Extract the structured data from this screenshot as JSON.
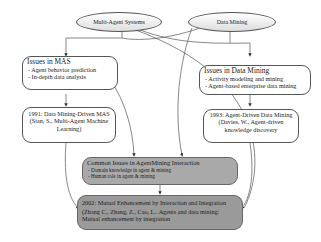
{
  "diagram": {
    "roots": [
      {
        "id": "mas",
        "label": "Multi-Agent Systems"
      },
      {
        "id": "dm",
        "label": "Data Mining"
      }
    ],
    "issues_mas": {
      "title": "Issues in MAS",
      "items": [
        "Agent behavior prediction",
        "In-depth data analysis"
      ]
    },
    "issues_dm": {
      "title": "Issues in Data Mining",
      "items": [
        "Activity modeling and mining",
        "Agent-based enterprise data mining"
      ]
    },
    "milestone_1991": {
      "lines": [
        "1991: Data Mining-Driven MAS",
        "(Sian, S., Multi-Agent Machine",
        "Learning)"
      ]
    },
    "milestone_1993": {
      "lines": [
        "1993: Agent-Driven Data Mining",
        "(Davies, W., Agent-driven",
        "knowledge discovery"
      ]
    },
    "common_issues": {
      "title": "Common Issues in AgentMining Interaction",
      "items": [
        "Domain knowledge in agent    & mining",
        "Human role in agent    & mining"
      ]
    },
    "milestone_2002": {
      "title": "2002: Mutual Enhancement by Interaction and Integration",
      "lines": [
        "(Zhang C., Zhang, Z., Cao, L.. Agents and data mining:",
        "Mutual enhancement by integration"
      ]
    },
    "colors": {
      "line": "#555555",
      "common_fill": "#a9a9a9",
      "enhancement_fill": "#9a9a9a",
      "root_fill_top": "#ffffff",
      "root_fill_bottom": "#dedede"
    }
  }
}
